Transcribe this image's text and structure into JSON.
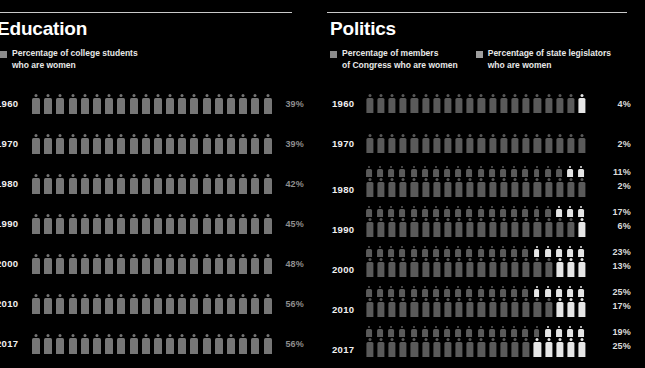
{
  "panels": [
    {
      "id": "education",
      "title": "Education",
      "legend": [
        {
          "label": "Percentage of college students\nwho are women",
          "color": "#8a8a8a",
          "series": "college_students"
        }
      ],
      "rows": [
        {
          "year": "1960",
          "bars": [
            {
              "series": "college_students",
              "value": 39,
              "label": "39%"
            }
          ]
        },
        {
          "year": "1970",
          "bars": [
            {
              "series": "college_students",
              "value": 39,
              "label": "39%"
            }
          ]
        },
        {
          "year": "1980",
          "bars": [
            {
              "series": "college_students",
              "value": 42,
              "label": "42%"
            }
          ]
        },
        {
          "year": "1990",
          "bars": [
            {
              "series": "college_students",
              "value": 45,
              "label": "45%"
            }
          ]
        },
        {
          "year": "2000",
          "bars": [
            {
              "series": "college_students",
              "value": 48,
              "label": "48%"
            }
          ]
        },
        {
          "year": "2010",
          "bars": [
            {
              "series": "college_students",
              "value": 56,
              "label": "56%"
            }
          ]
        },
        {
          "year": "2017",
          "bars": [
            {
              "series": "college_students",
              "value": 56,
              "label": "56%"
            }
          ]
        }
      ]
    },
    {
      "id": "politics",
      "title": "Politics",
      "legend": [
        {
          "label": "Percentage of members\nof Congress who are women",
          "color": "#8a8a8a",
          "series": "congress"
        },
        {
          "label": "Percentage of state legislators\nwho are women",
          "color": "#9e9e9e",
          "series": "state_legislators"
        }
      ],
      "rows": [
        {
          "year": "1960",
          "bars": [
            {
              "series": "congress",
              "value": 4,
              "label": "4%"
            }
          ]
        },
        {
          "year": "1970",
          "bars": [
            {
              "series": "congress",
              "value": 2,
              "label": "2%"
            }
          ]
        },
        {
          "year": "1980",
          "bars": [
            {
              "series": "state_legislators",
              "value": 11,
              "label": "11%"
            },
            {
              "series": "congress",
              "value": 2,
              "label": "2%"
            }
          ]
        },
        {
          "year": "1990",
          "bars": [
            {
              "series": "state_legislators",
              "value": 17,
              "label": "17%"
            },
            {
              "series": "congress",
              "value": 6,
              "label": "6%"
            }
          ]
        },
        {
          "year": "2000",
          "bars": [
            {
              "series": "state_legislators",
              "value": 23,
              "label": "23%"
            },
            {
              "series": "congress",
              "value": 13,
              "label": "13%"
            }
          ]
        },
        {
          "year": "2010",
          "bars": [
            {
              "series": "state_legislators",
              "value": 25,
              "label": "25%"
            },
            {
              "series": "congress",
              "value": 17,
              "label": "17%"
            }
          ]
        },
        {
          "year": "2017",
          "bars": [
            {
              "series": "state_legislators",
              "value": 19,
              "label": "19%"
            },
            {
              "series": "congress",
              "value": 25,
              "label": "25%"
            }
          ]
        }
      ]
    }
  ],
  "colors": {
    "background": "#000000",
    "rule": "#c9c9c9",
    "figure_base": "#5a5a5a",
    "figure_highlight": "#e6e6e6",
    "education_figure": "#767676",
    "education_pct": "#8e8e8e",
    "politics_pct": "#dcdcdc",
    "heading": "#ffffff"
  },
  "chart_data": {
    "type": "bar",
    "subtitle": "",
    "xlabel": "",
    "ylabel": "",
    "icons_per_row": 20,
    "categories": [
      "1960",
      "1970",
      "1980",
      "1990",
      "2000",
      "2010",
      "2017"
    ],
    "series": [
      {
        "name": "Percentage of college students who are women",
        "panel": "Education",
        "values": [
          39,
          39,
          42,
          45,
          48,
          56,
          56
        ],
        "unit": "%"
      },
      {
        "name": "Percentage of state legislators who are women",
        "panel": "Politics",
        "values": [
          null,
          null,
          11,
          17,
          23,
          25,
          19
        ],
        "unit": "%"
      },
      {
        "name": "Percentage of members of Congress who are women",
        "panel": "Politics",
        "values": [
          4,
          2,
          2,
          6,
          13,
          17,
          25
        ],
        "unit": "%"
      }
    ],
    "ylim": [
      0,
      100
    ],
    "grid": false,
    "legend_position": "top"
  }
}
